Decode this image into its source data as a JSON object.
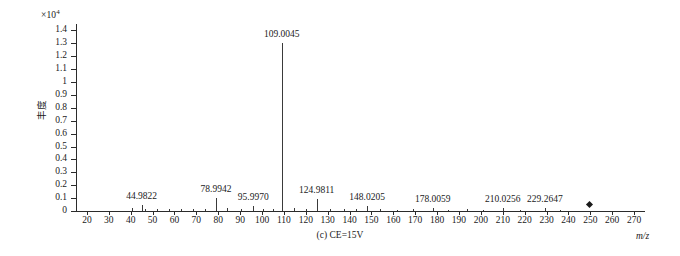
{
  "chart_data": {
    "type": "bar",
    "title": "",
    "caption": "(c) CE=15V",
    "xlabel": "m/z",
    "ylabel": "丰度",
    "y_exponent_prefix": "×10",
    "y_exponent_power": "4",
    "xlim": [
      15,
      275
    ],
    "ylim": [
      0,
      1.45
    ],
    "grid": false,
    "legend": null,
    "x_ticks": [
      20,
      30,
      40,
      50,
      60,
      70,
      80,
      90,
      100,
      110,
      120,
      130,
      140,
      150,
      160,
      170,
      180,
      190,
      200,
      210,
      220,
      230,
      240,
      250,
      260,
      270
    ],
    "x_tick_labels": [
      "20",
      "30",
      "40",
      "50",
      "60",
      "70",
      "80",
      "90",
      "100",
      "110",
      "120",
      "130",
      "140",
      "150",
      "160",
      "170",
      "180",
      "190",
      "200",
      "210",
      "220",
      "230",
      "240",
      "250",
      "260",
      "270"
    ],
    "y_ticks": [
      0,
      0.1,
      0.2,
      0.3,
      0.4,
      0.5,
      0.6,
      0.7,
      0.8,
      0.9,
      1.0,
      1.1,
      1.2,
      1.3,
      1.4
    ],
    "y_tick_labels": [
      "0",
      "0.1",
      "0.2",
      "0.3",
      "0.4",
      "0.5",
      "0.6",
      "0.7",
      "0.8",
      "0.9",
      "1",
      "1.1",
      "1.2",
      "1.3",
      "1.4"
    ],
    "labeled_peaks": [
      {
        "mz": 44.9822,
        "label": "44.9822",
        "intensity": 0.05
      },
      {
        "mz": 78.9942,
        "label": "78.9942",
        "intensity": 0.1
      },
      {
        "mz": 95.997,
        "label": "95.9970",
        "intensity": 0.04
      },
      {
        "mz": 109.0045,
        "label": "109.0045",
        "intensity": 1.3
      },
      {
        "mz": 124.9811,
        "label": "124.9811",
        "intensity": 0.09
      },
      {
        "mz": 148.0205,
        "label": "148.0205",
        "intensity": 0.035
      },
      {
        "mz": 178.0059,
        "label": "178.0059",
        "intensity": 0.02
      },
      {
        "mz": 210.0256,
        "label": "210.0256",
        "intensity": 0.02
      },
      {
        "mz": 229.2647,
        "label": "229.2647",
        "intensity": 0.02
      }
    ],
    "minor_peaks": [
      {
        "mz": 40.5,
        "intensity": 0.02
      },
      {
        "mz": 46.5,
        "intensity": 0.018
      },
      {
        "mz": 52.0,
        "intensity": 0.015
      },
      {
        "mz": 57.5,
        "intensity": 0.012
      },
      {
        "mz": 63.0,
        "intensity": 0.014
      },
      {
        "mz": 68.5,
        "intensity": 0.012
      },
      {
        "mz": 74.0,
        "intensity": 0.016
      },
      {
        "mz": 84.0,
        "intensity": 0.022
      },
      {
        "mz": 90.5,
        "intensity": 0.018
      },
      {
        "mz": 100.5,
        "intensity": 0.016
      },
      {
        "mz": 105.0,
        "intensity": 0.014
      },
      {
        "mz": 114.5,
        "intensity": 0.02
      },
      {
        "mz": 120.0,
        "intensity": 0.018
      },
      {
        "mz": 131.0,
        "intensity": 0.014
      },
      {
        "mz": 137.5,
        "intensity": 0.012
      },
      {
        "mz": 143.0,
        "intensity": 0.018
      },
      {
        "mz": 154.0,
        "intensity": 0.012
      },
      {
        "mz": 161.5,
        "intensity": 0.01
      },
      {
        "mz": 169.0,
        "intensity": 0.012
      },
      {
        "mz": 185.0,
        "intensity": 0.01
      },
      {
        "mz": 193.5,
        "intensity": 0.012
      },
      {
        "mz": 201.0,
        "intensity": 0.01
      },
      {
        "mz": 218.0,
        "intensity": 0.01
      },
      {
        "mz": 236.0,
        "intensity": 0.01
      }
    ],
    "stray_marker": {
      "mz": 249.5,
      "intensity": 0.055
    }
  }
}
